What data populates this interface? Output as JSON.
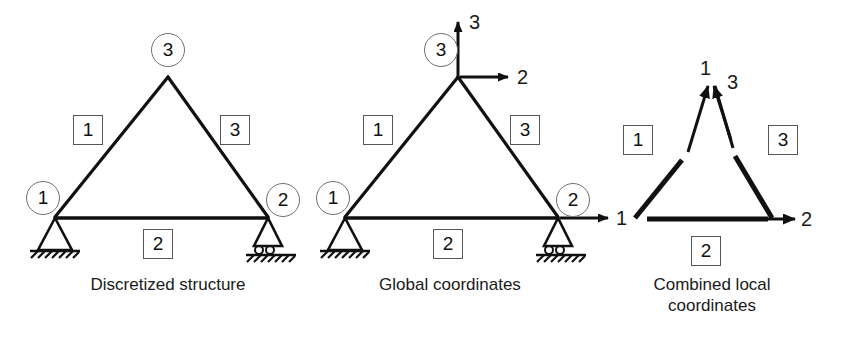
{
  "figure": {
    "ink_color": "#111111",
    "box_border_color": "#565656",
    "circle_border_color": "#707070",
    "background": "#ffffff"
  },
  "panels": [
    {
      "id": "discretized",
      "caption": "Discretized structure",
      "nodes": [
        {
          "id": "n1",
          "label": "1",
          "marker": "circle"
        },
        {
          "id": "n2",
          "label": "2",
          "marker": "circle"
        },
        {
          "id": "n3",
          "label": "3",
          "marker": "circle"
        }
      ],
      "elements": [
        {
          "id": "e1",
          "label": "1",
          "marker": "box"
        },
        {
          "id": "e2",
          "label": "2",
          "marker": "box"
        },
        {
          "id": "e3",
          "label": "3",
          "marker": "box"
        }
      ],
      "supports": [
        {
          "at": "n1",
          "type": "pinned-hatched"
        },
        {
          "at": "n2",
          "type": "roller-hatched"
        }
      ]
    },
    {
      "id": "global",
      "caption": "Global coordinates",
      "nodes": [
        {
          "id": "n1",
          "label": "1",
          "marker": "circle"
        },
        {
          "id": "n2",
          "label": "2",
          "marker": "circle"
        },
        {
          "id": "n3",
          "label": "3",
          "marker": "circle"
        }
      ],
      "elements": [
        {
          "id": "e1",
          "label": "1",
          "marker": "box"
        },
        {
          "id": "e2",
          "label": "2",
          "marker": "box"
        },
        {
          "id": "e3",
          "label": "3",
          "marker": "box"
        }
      ],
      "supports": [
        {
          "at": "n1",
          "type": "pinned-hatched"
        },
        {
          "at": "n2",
          "type": "roller-hatched"
        }
      ],
      "dof_arrows": [
        {
          "id": "dof1",
          "label": "1",
          "direction": "right",
          "origin": "n2"
        },
        {
          "id": "dof2",
          "label": "2",
          "direction": "right",
          "origin": "n3"
        },
        {
          "id": "dof3",
          "label": "3",
          "direction": "up",
          "origin": "n3"
        }
      ]
    },
    {
      "id": "local",
      "caption_line1": "Combined local",
      "caption_line2": "coordinates",
      "elements": [
        {
          "id": "e1",
          "label": "1",
          "marker": "box"
        },
        {
          "id": "e2",
          "label": "2",
          "marker": "box"
        },
        {
          "id": "e3",
          "label": "3",
          "marker": "box"
        }
      ],
      "dof_arrows": [
        {
          "id": "l1",
          "label": "1",
          "direction": "up-right",
          "note": "left member local axis"
        },
        {
          "id": "l3",
          "label": "3",
          "direction": "up-left",
          "note": "right member local axis"
        },
        {
          "id": "l2",
          "label": "2",
          "direction": "right",
          "note": "bottom member local axis"
        }
      ]
    }
  ]
}
